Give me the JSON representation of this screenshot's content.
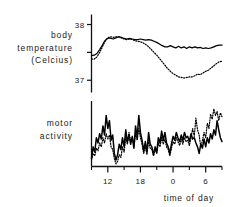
{
  "figure": {
    "panels": [
      {
        "name": "body-temperature",
        "ylabel_lines": [
          "body",
          "temperature",
          "(Celcius)"
        ],
        "ytick_labels": [
          "38",
          "37"
        ]
      },
      {
        "name": "motor-activity",
        "ylabel_lines": [
          "motor",
          "activity"
        ],
        "ytick_labels": []
      }
    ],
    "xlabel": "time of day",
    "xtick_labels": [
      "12",
      "18",
      "0",
      "6"
    ]
  },
  "chart_data": {
    "type": "line",
    "title": "",
    "xlabel": "time of day",
    "grid": false,
    "legend": "none",
    "x_axis": {
      "label": "time of day",
      "tick_labels": [
        "12",
        "18",
        "0",
        "6"
      ],
      "tick_values": [
        12,
        18,
        24,
        30
      ],
      "minor_tick_values": [
        9,
        15,
        21,
        27,
        33
      ],
      "range": [
        9,
        33
      ],
      "note": "hours of day, 24 = midnight (0), 30 = 6am"
    },
    "panels": [
      {
        "name": "body temperature",
        "ylabel": "body temperature (Celcius)",
        "ylim": [
          36.78,
          38.18
        ],
        "ytick_values": [
          38,
          37.5,
          37
        ],
        "ytick_labels": [
          "38",
          "",
          "37"
        ],
        "series": [
          {
            "name": "solid",
            "style": "solid",
            "x": [
              9.0,
              9.5,
              10.0,
              10.5,
              11.0,
              11.4,
              11.8,
              12.2,
              12.6,
              13.0,
              13.5,
              14.0,
              14.5,
              15.0,
              15.5,
              16.0,
              16.5,
              17.0,
              17.5,
              18.0,
              18.5,
              19.0,
              19.5,
              20.0,
              20.5,
              21.0,
              21.5,
              22.0,
              22.5,
              23.0,
              23.5,
              24.0,
              24.5,
              25.0,
              25.5,
              26.0,
              26.5,
              27.0,
              27.5,
              28.0,
              28.5,
              29.0,
              29.5,
              30.0,
              30.5,
              31.0,
              31.5,
              32.0,
              32.5,
              33.0
            ],
            "y": [
              37.44,
              37.45,
              37.48,
              37.55,
              37.63,
              37.7,
              37.74,
              37.76,
              37.75,
              37.74,
              37.76,
              37.78,
              37.77,
              37.75,
              37.74,
              37.75,
              37.74,
              37.73,
              37.73,
              37.74,
              37.73,
              37.72,
              37.73,
              37.72,
              37.7,
              37.68,
              37.65,
              37.62,
              37.6,
              37.6,
              37.62,
              37.6,
              37.58,
              37.61,
              37.58,
              37.6,
              37.57,
              37.6,
              37.58,
              37.6,
              37.58,
              37.59,
              37.57,
              37.58,
              37.57,
              37.58,
              37.6,
              37.62,
              37.63,
              37.63
            ]
          },
          {
            "name": "dotted",
            "style": "dotted",
            "x": [
              9.0,
              9.5,
              10.0,
              10.5,
              11.0,
              11.4,
              11.8,
              12.2,
              12.6,
              13.0,
              13.5,
              14.0,
              14.5,
              15.0,
              15.5,
              16.0,
              16.5,
              17.0,
              17.5,
              18.0,
              18.5,
              19.0,
              19.5,
              20.0,
              20.5,
              21.0,
              21.5,
              22.0,
              22.5,
              23.0,
              23.5,
              24.0,
              24.5,
              25.0,
              25.5,
              26.0,
              26.5,
              27.0,
              27.5,
              28.0,
              28.5,
              29.0,
              29.5,
              30.0,
              30.5,
              31.0,
              31.5,
              32.0,
              32.5,
              33.0
            ],
            "y": [
              37.38,
              37.38,
              37.42,
              37.5,
              37.6,
              37.68,
              37.74,
              37.77,
              37.78,
              37.77,
              37.78,
              37.78,
              37.76,
              37.74,
              37.73,
              37.74,
              37.73,
              37.71,
              37.7,
              37.69,
              37.67,
              37.64,
              37.6,
              37.55,
              37.5,
              37.45,
              37.39,
              37.33,
              37.27,
              37.21,
              37.16,
              37.12,
              37.09,
              37.06,
              37.05,
              37.04,
              37.05,
              37.06,
              37.06,
              37.08,
              37.11,
              37.1,
              37.13,
              37.16,
              37.18,
              37.22,
              37.26,
              37.3,
              37.33,
              37.34
            ]
          }
        ]
      },
      {
        "name": "motor activity",
        "ylabel": "motor activity",
        "ylim": [
          0,
          100
        ],
        "ytick_values": [],
        "ytick_labels": [],
        "series": [
          {
            "name": "solid",
            "style": "solid",
            "x": [
              9.0,
              9.3,
              9.6,
              9.9,
              10.2,
              10.5,
              10.8,
              11.1,
              11.4,
              11.7,
              12.0,
              12.3,
              12.6,
              12.9,
              13.2,
              13.5,
              13.8,
              14.1,
              14.4,
              14.7,
              15.0,
              15.3,
              15.6,
              15.9,
              16.2,
              16.5,
              16.8,
              17.1,
              17.4,
              17.7,
              18.0,
              18.3,
              18.6,
              18.9,
              19.2,
              19.5,
              19.8,
              20.1,
              20.4,
              20.7,
              21.0,
              21.3,
              21.6,
              21.9,
              22.2,
              22.5,
              22.8,
              23.1,
              23.4,
              23.7,
              24.0,
              24.3,
              24.6,
              24.9,
              25.2,
              25.5,
              25.8,
              26.1,
              26.4,
              26.7,
              27.0,
              27.3,
              27.6,
              27.9,
              28.2,
              28.5,
              28.8,
              29.1,
              29.4,
              29.7,
              30.0,
              30.3,
              30.6,
              30.9,
              31.2,
              31.5,
              31.8,
              32.1,
              32.4,
              32.7,
              33.0
            ],
            "y": [
              12,
              30,
              22,
              44,
              36,
              50,
              42,
              62,
              48,
              78,
              58,
              70,
              40,
              48,
              20,
              10,
              18,
              34,
              26,
              44,
              30,
              56,
              38,
              48,
              34,
              46,
              28,
              62,
              44,
              78,
              52,
              40,
              24,
              38,
              22,
              52,
              34,
              30,
              18,
              30,
              22,
              44,
              36,
              54,
              40,
              52,
              36,
              30,
              20,
              34,
              46,
              40,
              52,
              44,
              38,
              48,
              40,
              52,
              44,
              46,
              38,
              50,
              42,
              44,
              36,
              30,
              20,
              34,
              28,
              42,
              30,
              44,
              36,
              50,
              42,
              56,
              48,
              70,
              56,
              44,
              38
            ]
          },
          {
            "name": "dotted",
            "style": "dotted",
            "x": [
              9.0,
              9.3,
              9.6,
              9.9,
              10.2,
              10.5,
              10.8,
              11.1,
              11.4,
              11.7,
              12.0,
              12.3,
              12.6,
              12.9,
              13.2,
              13.5,
              13.8,
              14.1,
              14.4,
              14.7,
              15.0,
              15.3,
              15.6,
              15.9,
              16.2,
              16.5,
              16.8,
              17.1,
              17.4,
              17.7,
              18.0,
              18.3,
              18.6,
              18.9,
              19.2,
              19.5,
              19.8,
              20.1,
              20.4,
              20.7,
              21.0,
              21.3,
              21.6,
              21.9,
              22.2,
              22.5,
              22.8,
              23.1,
              23.4,
              23.7,
              24.0,
              24.3,
              24.6,
              24.9,
              25.2,
              25.5,
              25.8,
              26.1,
              26.4,
              26.7,
              27.0,
              27.3,
              27.6,
              27.9,
              28.2,
              28.5,
              28.8,
              29.1,
              29.4,
              29.7,
              30.0,
              30.3,
              30.6,
              30.9,
              31.2,
              31.5,
              31.8,
              32.1,
              32.4,
              32.7,
              33.0
            ],
            "y": [
              10,
              20,
              16,
              28,
              24,
              36,
              30,
              44,
              36,
              50,
              42,
              48,
              30,
              26,
              12,
              4,
              8,
              18,
              14,
              30,
              22,
              44,
              34,
              52,
              38,
              44,
              30,
              50,
              40,
              58,
              44,
              34,
              20,
              30,
              18,
              40,
              28,
              26,
              16,
              26,
              20,
              36,
              30,
              44,
              34,
              42,
              30,
              26,
              16,
              28,
              38,
              34,
              44,
              38,
              32,
              42,
              34,
              44,
              38,
              40,
              32,
              44,
              58,
              46,
              74,
              56,
              48,
              30,
              40,
              52,
              44,
              66,
              58,
              80,
              72,
              88,
              78,
              84,
              70,
              82,
              76
            ]
          }
        ]
      }
    ]
  }
}
